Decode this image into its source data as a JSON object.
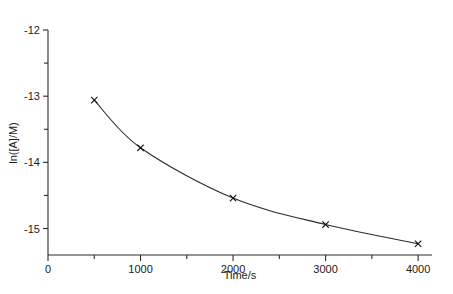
{
  "chart_data": {
    "type": "line",
    "title": "",
    "xlabel": "Time/s",
    "ylabel": "ln([A]/M)",
    "x": [
      500,
      1000,
      2000,
      3000,
      4000
    ],
    "values": [
      -13.06,
      -13.78,
      -14.54,
      -14.94,
      -15.23
    ],
    "series": [
      {
        "name": "ln([A]/M)",
        "x": [
          500,
          1000,
          2000,
          3000,
          4000
        ],
        "values": [
          -13.06,
          -13.78,
          -14.54,
          -14.94,
          -15.23
        ]
      }
    ],
    "marker": "x",
    "line_style": "smooth-curve",
    "xlim": [
      0,
      4150
    ],
    "ylim": [
      -15.4,
      -12.0
    ],
    "xticks": [
      0,
      1000,
      2000,
      3000,
      4000
    ],
    "xticklabels": [
      "0",
      "1000",
      "2000",
      "3000",
      "4000"
    ],
    "xminorticks": [
      500,
      1500,
      2500,
      3500
    ],
    "yticks": [
      -12,
      -13,
      -14,
      -15
    ],
    "yticklabels": [
      "-12",
      "-13",
      "-14",
      "-15"
    ],
    "yminorticks": [
      -12.5,
      -13.5,
      -14.5
    ],
    "grid": false,
    "legend": false,
    "legend_position": "none",
    "colors": {
      "line": "#2b2b2b",
      "marker": "#111111",
      "axis": "#2b2b2b",
      "background": "#ffffff",
      "text": "#1a1a1a"
    }
  },
  "axes": {
    "x_label": "Time/s",
    "y_label": "ln([A]/M)",
    "x_tick_labels": [
      "0",
      "1000",
      "2000",
      "3000",
      "4000"
    ],
    "y_tick_labels": [
      "-12",
      "-13",
      "-14",
      "-15"
    ]
  }
}
